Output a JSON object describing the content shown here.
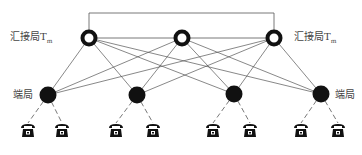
{
  "diagram": {
    "tandem_label": "汇接局T",
    "tandem_subscript": "m",
    "end_office_label": "端局",
    "tandem_nodes": [
      {
        "x": 89,
        "y": 38
      },
      {
        "x": 182,
        "y": 38
      },
      {
        "x": 274,
        "y": 38
      }
    ],
    "end_offices": [
      {
        "x": 48,
        "y": 95,
        "phones": [
          28,
          62
        ]
      },
      {
        "x": 137,
        "y": 95,
        "phones": [
          116,
          153
        ]
      },
      {
        "x": 234,
        "y": 94,
        "phones": [
          213,
          250
        ]
      },
      {
        "x": 321,
        "y": 94,
        "phones": [
          301,
          338
        ]
      }
    ],
    "phone_y": 131,
    "colors": {
      "line": "#555555",
      "node": "#111111"
    }
  }
}
